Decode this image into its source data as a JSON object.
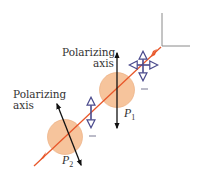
{
  "diagram": {
    "labels": {
      "p1_axis_line1": "Polarizing",
      "p1_axis_line2": "axis",
      "p2_axis_line1": "Polarizing",
      "p2_axis_line2": "axis",
      "p1_name": "P",
      "p1_sub": "1",
      "p2_name": "P",
      "p2_sub": "2"
    },
    "elements": {
      "beam": {
        "color": "#e8572a",
        "direction": "down-left"
      },
      "polarizers": [
        {
          "name": "P1",
          "fill": "#f6c49c",
          "axis": "vertical"
        },
        {
          "name": "P2",
          "fill": "#f6c49c",
          "axis": "tilted"
        }
      ],
      "polarization_arrows": [
        {
          "type": "unpolarized-cross",
          "color": "#4a4a8c"
        },
        {
          "type": "vertical",
          "color": "#4a4a8c"
        }
      ],
      "axis_arrow_color": "#111111",
      "corner_color": "#8a8a8a"
    }
  }
}
